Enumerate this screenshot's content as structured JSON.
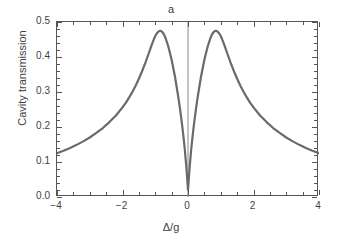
{
  "figure": {
    "panel_label": "a",
    "background_color": "#ffffff",
    "axis_color": "#555555",
    "curve_color": "#6a6a6a",
    "vline_color": "#888888"
  },
  "chart_data": {
    "type": "line",
    "title": "a",
    "xlabel": "Δ/g",
    "ylabel": "Cavity transmission",
    "xlim": [
      -4,
      4
    ],
    "ylim": [
      0.0,
      0.5
    ],
    "grid": false,
    "legend": null,
    "xticks": [
      -4,
      -2,
      0,
      2,
      4
    ],
    "xticklabels": [
      "−4",
      "−2",
      "0",
      "2",
      "4"
    ],
    "xminor_step": 0.5,
    "yticks": [
      0.0,
      0.1,
      0.2,
      0.3,
      0.4,
      0.5
    ],
    "yticklabels": [
      "0.0",
      "0.1",
      "0.2",
      "0.3",
      "0.4",
      "0.5"
    ],
    "yminor_step": 0.02,
    "annotations": [
      {
        "name": "center-vertical-line",
        "type": "vline",
        "x": 0
      }
    ],
    "series": [
      {
        "name": "Cavity transmission",
        "color": "#6a6a6a",
        "linewidth": 2.2,
        "x": [
          -4.0,
          -3.8,
          -3.6,
          -3.4,
          -3.2,
          -3.0,
          -2.8,
          -2.6,
          -2.4,
          -2.2,
          -2.0,
          -1.9,
          -1.8,
          -1.7,
          -1.6,
          -1.5,
          -1.4,
          -1.3,
          -1.2,
          -1.15,
          -1.1,
          -1.05,
          -1.0,
          -0.95,
          -0.9,
          -0.85,
          -0.8,
          -0.75,
          -0.7,
          -0.6,
          -0.5,
          -0.4,
          -0.3,
          -0.25,
          -0.2,
          -0.15,
          -0.1,
          -0.05,
          0.0,
          0.05,
          0.1,
          0.15,
          0.2,
          0.25,
          0.3,
          0.4,
          0.5,
          0.6,
          0.7,
          0.75,
          0.8,
          0.85,
          0.9,
          0.95,
          1.0,
          1.05,
          1.1,
          1.15,
          1.2,
          1.3,
          1.4,
          1.5,
          1.6,
          1.7,
          1.8,
          1.9,
          2.0,
          2.2,
          2.4,
          2.6,
          2.8,
          3.0,
          3.2,
          3.4,
          3.6,
          3.8,
          4.0
        ],
        "y": [
          0.125,
          0.132,
          0.14,
          0.149,
          0.159,
          0.17,
          0.183,
          0.197,
          0.214,
          0.233,
          0.256,
          0.269,
          0.284,
          0.3,
          0.318,
          0.338,
          0.36,
          0.384,
          0.41,
          0.423,
          0.437,
          0.449,
          0.46,
          0.468,
          0.473,
          0.475,
          0.473,
          0.467,
          0.458,
          0.43,
          0.392,
          0.345,
          0.288,
          0.256,
          0.221,
          0.182,
          0.138,
          0.085,
          0.02,
          0.085,
          0.138,
          0.182,
          0.221,
          0.256,
          0.288,
          0.345,
          0.392,
          0.43,
          0.458,
          0.467,
          0.473,
          0.475,
          0.473,
          0.468,
          0.46,
          0.449,
          0.437,
          0.423,
          0.41,
          0.384,
          0.36,
          0.338,
          0.318,
          0.3,
          0.284,
          0.269,
          0.256,
          0.233,
          0.214,
          0.197,
          0.183,
          0.17,
          0.159,
          0.149,
          0.14,
          0.132,
          0.125
        ]
      }
    ],
    "peaks": [
      {
        "x": -1.0,
        "y": 0.475
      },
      {
        "x": 1.0,
        "y": 0.475
      }
    ],
    "minimum": {
      "x": 0.0,
      "y": 0.02
    }
  }
}
